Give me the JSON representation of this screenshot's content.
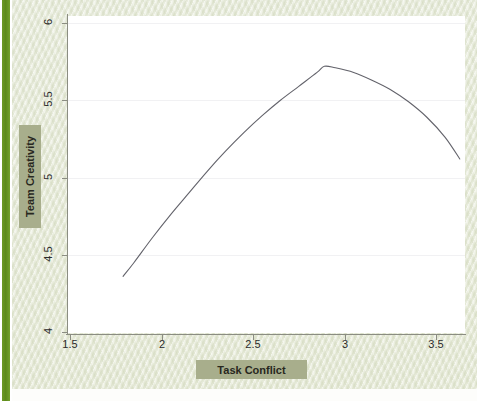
{
  "figure": {
    "background_color": "#e9edde",
    "plot_background_color": "#ffffff",
    "accent_bar_color": "#6d9a25",
    "plaque_color": "#a8ae8c",
    "curve_color": "#63636b",
    "gridline_color": "#f1f1f3"
  },
  "chart_data": {
    "type": "line",
    "title": "",
    "xlabel": "Task Conflict",
    "ylabel": "Team Creativity",
    "xlim": [
      1.44,
      3.78
    ],
    "ylim": [
      3.9,
      6.06
    ],
    "xticks": [
      1.5,
      2,
      2.5,
      3,
      3.5
    ],
    "xtick_labels": [
      "1.5",
      "2",
      "2.5",
      "3",
      "3.5"
    ],
    "yticks": [
      4,
      4.5,
      5,
      5.5,
      6
    ],
    "ytick_labels": [
      "4",
      "4.5",
      "5",
      "5.5",
      "6"
    ],
    "grid": true,
    "grid_axis": "y",
    "legend": null,
    "series": [
      {
        "name": "Team Creativity vs Task Conflict",
        "shape": "inverted-u (quadratic)",
        "x": [
          1.79,
          1.85,
          1.95,
          2.05,
          2.15,
          2.25,
          2.35,
          2.45,
          2.55,
          2.65,
          2.75,
          2.85,
          2.89,
          2.95,
          3.05,
          3.15,
          3.25,
          3.35,
          3.45,
          3.55,
          3.63
        ],
        "y": [
          4.36,
          4.45,
          4.61,
          4.76,
          4.9,
          5.04,
          5.17,
          5.29,
          5.4,
          5.5,
          5.59,
          5.68,
          5.72,
          5.71,
          5.68,
          5.63,
          5.57,
          5.49,
          5.39,
          5.26,
          5.12
        ]
      }
    ]
  }
}
